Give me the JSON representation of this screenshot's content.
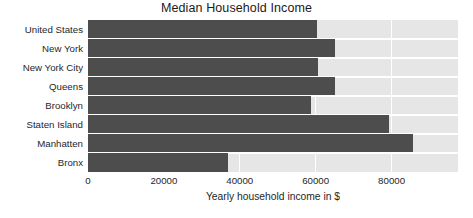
{
  "chart_data": {
    "type": "bar",
    "orientation": "horizontal",
    "title": "Median Household Income",
    "xlabel": "Yearly household income in $",
    "ylabel": "",
    "categories": [
      "United States",
      "New York",
      "New York City",
      "Queens",
      "Brooklyn",
      "Staten Island",
      "Manhatten",
      "Bronx"
    ],
    "values": [
      60300,
      65200,
      60700,
      65000,
      58800,
      79200,
      85600,
      36800
    ],
    "xlim": [
      0,
      97500
    ],
    "xticks": [
      0,
      20000,
      40000,
      60000,
      80000
    ],
    "xtick_labels": [
      "0",
      "20000",
      "40000",
      "60000",
      "80000"
    ],
    "grid": true,
    "grid_axis": "x",
    "legend": false,
    "bar_color": "#4d4d4d",
    "plot_background": "#e6e6e6",
    "gridline_color": "#ffffff",
    "figure_background": "#ffffff",
    "text_color": "#262626"
  }
}
